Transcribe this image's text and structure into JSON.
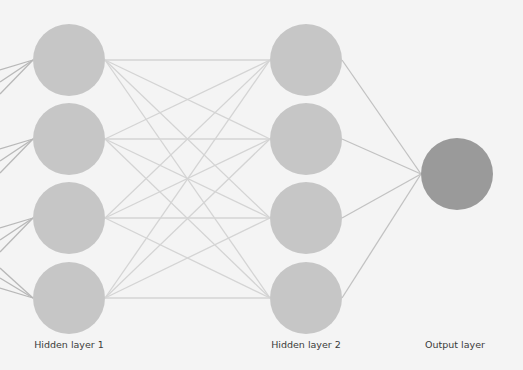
{
  "diagram": {
    "type": "neural-network",
    "background": "#f4f4f4",
    "edge_color_dense": "#d4d4d4",
    "edge_color_output": "#c2c2c2",
    "hidden_node_color": "#c6c6c6",
    "output_node_color": "#9a9a9a",
    "node_radius": 36,
    "layers": [
      {
        "id": "input",
        "label": "",
        "visible": false,
        "note": "input connections enter from the left edge (3 per hidden-1 node)"
      },
      {
        "id": "hidden1",
        "label": "Hidden layer 1",
        "x": 69,
        "nodes": [
          60,
          139,
          218,
          298
        ]
      },
      {
        "id": "hidden2",
        "label": "Hidden layer 2",
        "x": 306,
        "nodes": [
          60,
          139,
          218,
          298
        ]
      },
      {
        "id": "output",
        "label": "Output layer",
        "x": 457,
        "nodes": [
          174
        ]
      }
    ],
    "connections": {
      "input_to_hidden1": "3 partial edges per node from left edge",
      "hidden1_to_hidden2": "fully connected (16 edges)",
      "hidden2_to_output": "fully connected (4 edges)"
    }
  },
  "labels": {
    "hidden1": "Hidden layer 1",
    "hidden2": "Hidden layer 2",
    "output": "Output layer"
  }
}
